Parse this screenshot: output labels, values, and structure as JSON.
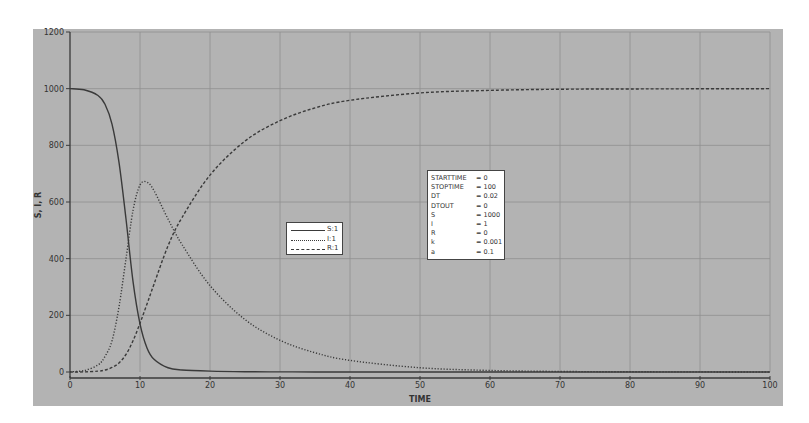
{
  "chart_data": {
    "type": "line",
    "title": "",
    "xlabel": "TIME",
    "ylabel": "S, I, R",
    "xlim": [
      0,
      100
    ],
    "ylim": [
      0,
      1200
    ],
    "x_ticks": [
      0,
      10,
      20,
      30,
      40,
      50,
      60,
      70,
      80,
      90,
      100
    ],
    "y_ticks": [
      0,
      200,
      400,
      600,
      800,
      1000,
      1200
    ],
    "grid": true,
    "legend_position": "center-left (inside plot)",
    "x": [
      0,
      2,
      4,
      5,
      6,
      7,
      8,
      9,
      10,
      11,
      12,
      14,
      16,
      20,
      25,
      30,
      35,
      40,
      50,
      60,
      70,
      80,
      100
    ],
    "series": [
      {
        "name": "S:1",
        "style": "solid",
        "values": [
          1000,
          996,
          976,
          945,
          875,
          740,
          540,
          320,
          170,
          85,
          45,
          15,
          7,
          3,
          1,
          0.5,
          0,
          0,
          0,
          0,
          0,
          0,
          0
        ]
      },
      {
        "name": "I:1",
        "style": "dotted",
        "values": [
          1,
          5,
          25,
          55,
          110,
          230,
          400,
          570,
          660,
          670,
          640,
          540,
          450,
          305,
          185,
          112,
          68,
          41,
          15,
          5.5,
          2,
          0.8,
          0
        ]
      },
      {
        "name": "R:1",
        "style": "dashed",
        "values": [
          0,
          0.5,
          3,
          7,
          16,
          32,
          62,
          110,
          172,
          240,
          310,
          445,
          545,
          695,
          815,
          887,
          932,
          959,
          985,
          994,
          998,
          999,
          1000
        ]
      }
    ],
    "annotations": [
      {
        "text": "STARTTIME = 0"
      },
      {
        "text": "STOPTIME = 100"
      },
      {
        "text": "DT = 0.02"
      },
      {
        "text": "DTOUT = 0"
      },
      {
        "text": "S = 1000"
      },
      {
        "text": "I = 1"
      },
      {
        "text": "R = 0"
      },
      {
        "text": "k = 0.001"
      },
      {
        "text": "a = 0.1"
      }
    ]
  },
  "legend": {
    "items": [
      {
        "label": "S:1",
        "style": "solid"
      },
      {
        "label": "I:1",
        "style": "dotted"
      },
      {
        "label": "R:1",
        "style": "dashed"
      }
    ]
  },
  "params": [
    {
      "name": "STARTTIME",
      "value": "= 0"
    },
    {
      "name": "STOPTIME",
      "value": "= 100"
    },
    {
      "name": "DT",
      "value": "= 0.02"
    },
    {
      "name": "DTOUT",
      "value": "= 0"
    },
    {
      "name": "S",
      "value": "= 1000"
    },
    {
      "name": "I",
      "value": "= 1"
    },
    {
      "name": "R",
      "value": "= 0"
    },
    {
      "name": "k",
      "value": "= 0.001"
    },
    {
      "name": "a",
      "value": "= 0.1"
    }
  ],
  "colors": {
    "panel": "#b3b3b3",
    "grid": "#8f8f8f",
    "curve": "#3a3a3a",
    "axis": "#3a3a3a"
  }
}
